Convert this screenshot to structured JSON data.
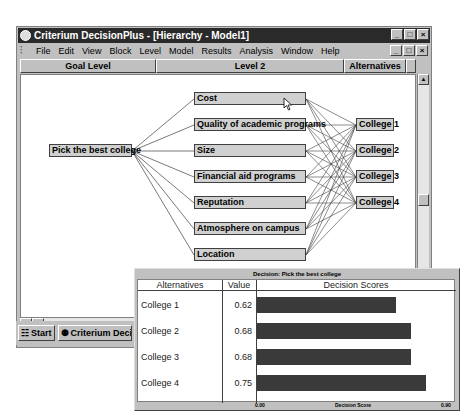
{
  "window": {
    "title": "Criterium DecisionPlus - [Hierarchy - Model1]",
    "buttons": [
      "_",
      "□",
      "×"
    ]
  },
  "menubar": {
    "items": [
      "File",
      "Edit",
      "View",
      "Block",
      "Level",
      "Model",
      "Results",
      "Analysis",
      "Window",
      "Help"
    ]
  },
  "levels": [
    "Goal Level",
    "Level 2",
    "Alternatives"
  ],
  "hierarchy": {
    "goal": "Pick the best college",
    "criteria": [
      "Cost",
      "Quality of academic programs",
      "Size",
      "Financial aid programs",
      "Reputation",
      "Atmosphere on campus",
      "Location"
    ],
    "alternatives": [
      "College 1",
      "College 2",
      "College 3",
      "College 4"
    ]
  },
  "taskbar": {
    "start": "Start",
    "task": "Criterium Decision"
  },
  "decision_popup": {
    "title": "Decision: Pick the best college",
    "headers": [
      "Alternatives",
      "Value",
      "Decision Scores"
    ],
    "rows": [
      {
        "name": "College 1",
        "value": "0.62"
      },
      {
        "name": "College 2",
        "value": "0.68"
      },
      {
        "name": "College 3",
        "value": "0.68"
      },
      {
        "name": "College 4",
        "value": "0.75"
      }
    ],
    "axis_min": "0.00",
    "axis_label": "Decision Score",
    "axis_max": "0.90"
  },
  "chart_data": {
    "type": "bar",
    "title": "Decision: Pick the best college",
    "categories": [
      "College 1",
      "College 2",
      "College 3",
      "College 4"
    ],
    "values": [
      0.62,
      0.68,
      0.68,
      0.75
    ],
    "xlabel": "Decision Score",
    "ylabel": "Alternatives",
    "xlim": [
      0.0,
      0.9
    ],
    "orientation": "horizontal",
    "bar_color": "#3a3a3a"
  }
}
